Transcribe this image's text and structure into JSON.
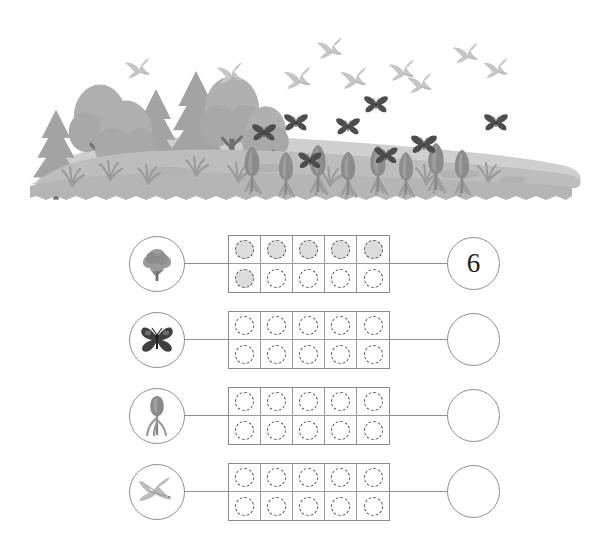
{
  "scene": {
    "name": "spring-meadow-illustration",
    "description": "Grayscale spring meadow with conifer and deciduous trees, flying birds, butterflies and blooming crocus flowers",
    "colors": {
      "sky": "#ffffff",
      "ground_far": "#c9c9c9",
      "ground_near": "#b5b5b5",
      "tree_light": "#b9b9b9",
      "tree_mid": "#a8a8a8",
      "tree_dark": "#8f8f8f",
      "trunk": "#6f6f6f",
      "bird": "#c2c2c2",
      "butterfly": "#4d4d4d"
    },
    "counts": {
      "trees": 8,
      "birds": 9,
      "butterflies": 8,
      "flowers": 9
    }
  },
  "worksheet": {
    "frame_columns": 5,
    "frame_rows": 2,
    "line_color": "#8e8e8e",
    "dot_fill_color": "#dcdcdc",
    "dot_border_color": "#4a4a4a",
    "rows": [
      {
        "icon": "tree-icon",
        "icon_label": "tree",
        "filled": 6,
        "answer": "6",
        "dots": [
          true,
          true,
          true,
          true,
          true,
          true,
          false,
          false,
          false,
          false
        ]
      },
      {
        "icon": "butterfly-icon",
        "icon_label": "butterfly",
        "filled": 0,
        "answer": "",
        "dots": [
          false,
          false,
          false,
          false,
          false,
          false,
          false,
          false,
          false,
          false
        ]
      },
      {
        "icon": "flower-icon",
        "icon_label": "crocus flower",
        "filled": 0,
        "answer": "",
        "dots": [
          false,
          false,
          false,
          false,
          false,
          false,
          false,
          false,
          false,
          false
        ]
      },
      {
        "icon": "bird-icon",
        "icon_label": "bird",
        "filled": 0,
        "answer": "",
        "dots": [
          false,
          false,
          false,
          false,
          false,
          false,
          false,
          false,
          false,
          false
        ]
      }
    ]
  }
}
